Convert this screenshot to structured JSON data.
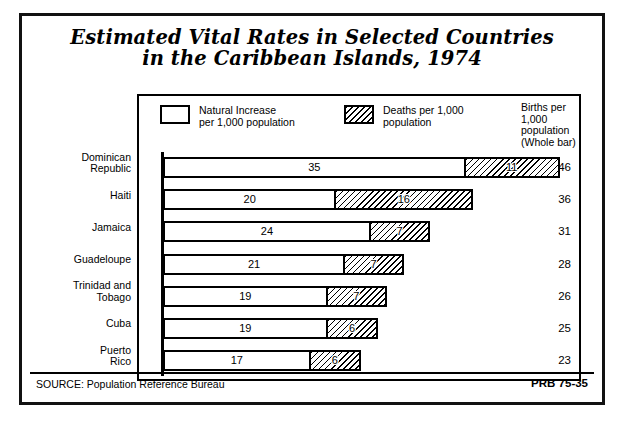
{
  "poster": {
    "title_line1": "Estimated Vital Rates in Selected Countries",
    "title_line2": "in the Caribbean Islands, 1974",
    "source_label": "SOURCE: Population Reference Bureau",
    "publication_code": "PRB 75-35"
  },
  "legend": {
    "natural_increase": "Natural Increase\nper 1,000 population",
    "deaths": "Deaths per 1,000\npopulation",
    "births_header": "Births per\n1,000\npopulation\n(Whole bar)"
  },
  "chart_data": {
    "type": "bar",
    "orientation": "horizontal",
    "stacked": true,
    "title": "Estimated Vital Rates in Selected Countries in the Caribbean Islands, 1974",
    "xlabel": "",
    "ylabel": "",
    "xlim": [
      0,
      46
    ],
    "grid": false,
    "legend_position": "top",
    "categories": [
      "Dominican\nRepublic",
      "Haiti",
      "Jamaica",
      "Guadeloupe",
      "Trinidad and\nTobago",
      "Cuba",
      "Puerto\nRico"
    ],
    "series": [
      {
        "name": "Natural Increase per 1,000 population",
        "style": "white",
        "values": [
          35,
          20,
          24,
          21,
          19,
          19,
          17
        ]
      },
      {
        "name": "Deaths per 1,000 population",
        "style": "hatched",
        "values": [
          11,
          16,
          7,
          7,
          7,
          6,
          6
        ]
      }
    ],
    "totals_label": "Births per 1,000 population (Whole bar)",
    "totals": [
      46,
      36,
      31,
      28,
      26,
      25,
      23
    ]
  }
}
